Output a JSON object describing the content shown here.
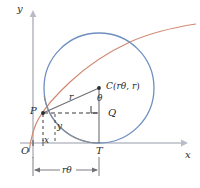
{
  "figure": {
    "axes": {
      "y_label": "y",
      "x_label": "x",
      "origin_label": "O"
    },
    "points": {
      "P": "P",
      "T": "T",
      "Q": "Q",
      "C_prefix": "C(",
      "C_x": "rθ",
      "C_sep": ", ",
      "C_y": "r",
      "C_suffix": ")"
    },
    "segments": {
      "radius_label": "r",
      "angle_label": "θ",
      "x_offset_label": "x",
      "y_offset_label": "y",
      "dimension_prefix": "",
      "dimension_r": "r",
      "dimension_theta": "θ"
    },
    "colors": {
      "circle": "#6e8fbf",
      "cycloid": "#d08a72",
      "axis": "#b9bcc4",
      "construction": "#6f6f74",
      "text": "#2b2b2b",
      "background": "#ffffff"
    },
    "geometry": {
      "origin_px": [
        33,
        143
      ],
      "P_px": [
        43,
        113
      ],
      "T_px": [
        99,
        143
      ],
      "Q_px": [
        99,
        113
      ],
      "C_px": [
        99,
        88
      ],
      "circle_radius_px": 55,
      "x_axis_right_px": 183,
      "y_axis_top_px": 14
    }
  }
}
